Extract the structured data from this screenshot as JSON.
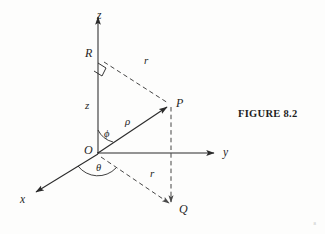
{
  "figure": {
    "caption": "FIGURE 8.2",
    "page_mark": "8",
    "stroke_color": "#2b2b2b",
    "background_color": "#fdfdfc"
  },
  "axes": [
    {
      "id": "x",
      "label": "x",
      "label_x": 20,
      "label_y": 194
    },
    {
      "id": "y",
      "label": "y",
      "label_x": 223,
      "label_y": 147
    },
    {
      "id": "z",
      "label": "z",
      "label_x": 97,
      "label_y": 10
    }
  ],
  "points": [
    {
      "id": "O",
      "label": "O",
      "label_x": 84,
      "label_y": 144,
      "x": 97,
      "y": 153
    },
    {
      "id": "P",
      "label": "P",
      "label_x": 176,
      "label_y": 97,
      "x": 170,
      "y": 105
    },
    {
      "id": "Q",
      "label": "Q",
      "label_x": 179,
      "label_y": 203,
      "x": 172,
      "y": 208
    },
    {
      "id": "R",
      "label": "R",
      "label_x": 85,
      "label_y": 47,
      "x": 98,
      "y": 58
    }
  ],
  "lengths": [
    {
      "id": "r-upper",
      "label": "r",
      "label_x": 144,
      "label_y": 55
    },
    {
      "id": "r-lower",
      "label": "r",
      "label_x": 150,
      "label_y": 168
    },
    {
      "id": "z-height",
      "label": "z",
      "label_x": 85,
      "label_y": 100
    },
    {
      "id": "rho",
      "label": "ρ",
      "label_x": 125,
      "label_y": 116
    }
  ],
  "angles": [
    {
      "id": "phi",
      "label": "ϕ",
      "label_x": 104,
      "label_y": 129,
      "between": "z-axis and rho"
    },
    {
      "id": "theta",
      "label": "θ",
      "label_x": 96,
      "label_y": 163,
      "between": "x-axis and OQ"
    }
  ]
}
